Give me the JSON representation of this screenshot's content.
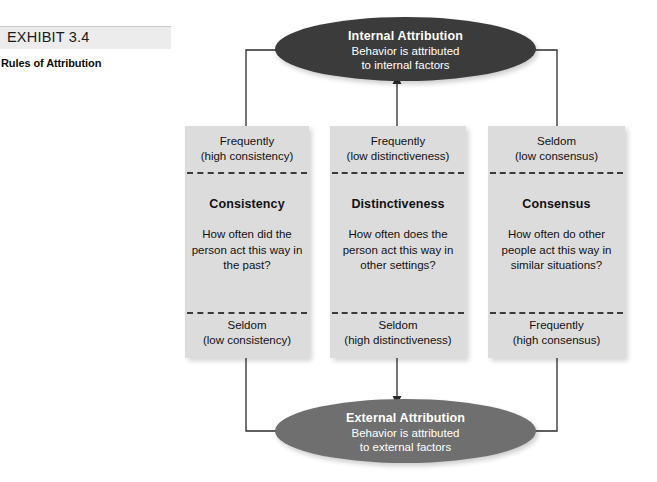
{
  "exhibit": {
    "label": "EXHIBIT 3.4",
    "subtitle": "Rules of Attribution"
  },
  "nodes": {
    "internal": {
      "title": "Internal Attribution",
      "line1": "Behavior is attributed",
      "line2": "to internal factors",
      "fill": "#3b3b3b"
    },
    "external": {
      "title": "External Attribution",
      "line1": "Behavior is attributed",
      "line2": "to external factors",
      "fill": "#6f6f6f"
    }
  },
  "factors": [
    {
      "id": "consistency",
      "heading": "Consistency",
      "question": "How often did the person act this way in the past?",
      "top_cap_line1": "Frequently",
      "top_cap_line2": "(high consistency)",
      "bottom_cap_line1": "Seldom",
      "bottom_cap_line2": "(low consistency)"
    },
    {
      "id": "distinctiveness",
      "heading": "Distinctiveness",
      "question": "How often does the person act this way in other settings?",
      "top_cap_line1": "Frequently",
      "top_cap_line2": "(low distinctiveness)",
      "bottom_cap_line1": "Seldom",
      "bottom_cap_line2": "(high distinctiveness)"
    },
    {
      "id": "consensus",
      "heading": "Consensus",
      "question": "How often do other people act this way in similar situations?",
      "top_cap_line1": "Seldom",
      "top_cap_line2": "(low consensus)",
      "bottom_cap_line1": "Frequently",
      "bottom_cap_line2": "(high consensus)"
    }
  ],
  "colors": {
    "box_fill": "#dcdcdc",
    "header_fill": "#ececec",
    "line": "#2b2b2b"
  }
}
